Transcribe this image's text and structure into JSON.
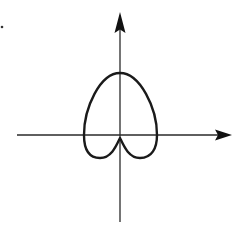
{
  "figure": {
    "description": "Polar curve sketch (limaçon-like, cusped bottom) on x-y axes",
    "labels": []
  },
  "colors": {
    "background": "#ffffff",
    "ink": "#1a1a1a"
  },
  "axes": {
    "origin": [
      120,
      135
    ],
    "x_axis": {
      "from": [
        17,
        135
      ],
      "to": [
        232,
        135
      ],
      "arrow": "right"
    },
    "y_axis": {
      "from": [
        120,
        222
      ],
      "to": [
        120,
        12
      ],
      "arrow": "up"
    }
  },
  "curve": {
    "type": "closed-loop",
    "top": [
      120,
      73
    ],
    "left_extent": [
      84,
      135
    ],
    "right_extent": [
      157,
      135
    ],
    "bottom_lobes_y": 158,
    "cusp": [
      120,
      138
    ]
  },
  "marks": [
    {
      "name": "stray-dot",
      "position": [
        2,
        27
      ]
    }
  ]
}
